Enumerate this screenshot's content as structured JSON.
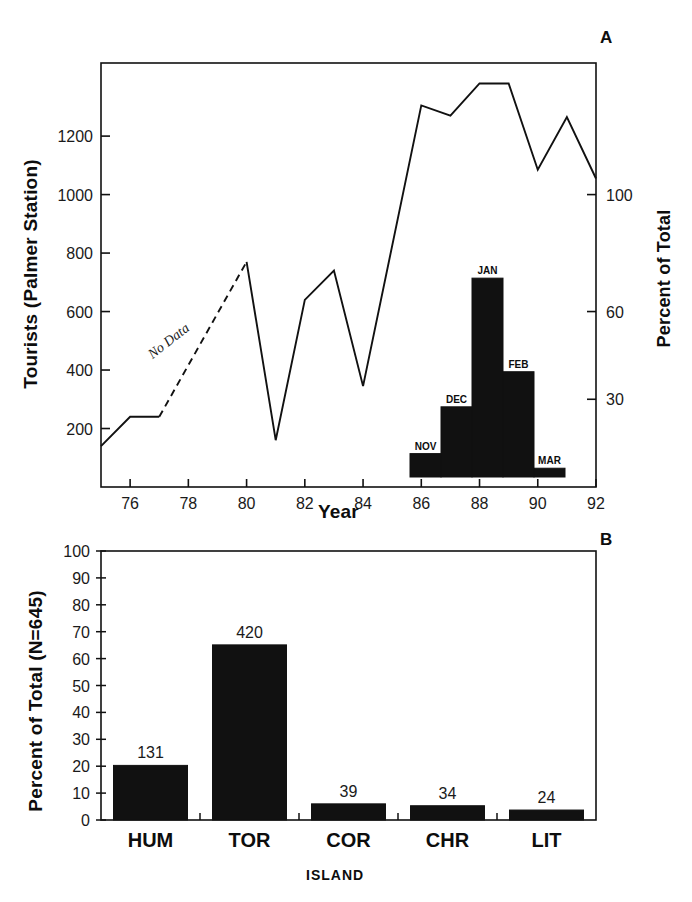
{
  "figure": {
    "panels": [
      {
        "letter": "A",
        "ylabel": "Tourists (Palmer Station)",
        "ylabel_right": "Percent of Total",
        "xlabel": "Year",
        "annotation": "No Data"
      },
      {
        "letter": "B",
        "ylabel": "Percent of Total (N=645)",
        "xlabel": "ISLAND"
      }
    ]
  },
  "chart_data": [
    {
      "type": "line",
      "panel": "A",
      "title": "",
      "xlabel": "Year",
      "ylabel": "Tourists (Palmer Station)",
      "ylabel_right": "Percent of Total",
      "xlim": [
        75,
        92
      ],
      "ylim": [
        0,
        1450
      ],
      "ylim_right": [
        0,
        145
      ],
      "grid": false,
      "legend": "none",
      "xticks": [
        76,
        78,
        80,
        82,
        84,
        86,
        88,
        90,
        92
      ],
      "xtick_labels": [
        "76",
        "78",
        "80",
        "82",
        "84",
        "86",
        "88",
        "90",
        "92"
      ],
      "yticks": [
        200,
        400,
        600,
        800,
        1000,
        1200
      ],
      "ytick_labels": [
        "200",
        "400",
        "600",
        "800",
        "1000",
        "1200"
      ],
      "yticks_right": [
        30,
        60,
        100
      ],
      "ytick_labels_right": [
        "30",
        "60",
        "100"
      ],
      "x": [
        75,
        76,
        77,
        80,
        81,
        82,
        83,
        84,
        86,
        87,
        88,
        89,
        90,
        91,
        92
      ],
      "values": [
        140,
        240,
        240,
        770,
        160,
        640,
        740,
        345,
        1305,
        1270,
        1380,
        1380,
        1085,
        1265,
        1055
      ],
      "segments": [
        {
          "style": "solid",
          "x": [
            75,
            76,
            77
          ],
          "y": [
            140,
            240,
            240
          ]
        },
        {
          "style": "dashed",
          "x": [
            77,
            80
          ],
          "y": [
            240,
            770
          ],
          "annotation": "No Data"
        },
        {
          "style": "solid",
          "x": [
            80,
            81,
            82,
            83,
            84,
            86,
            87,
            88,
            89,
            90,
            91,
            92
          ],
          "y": [
            770,
            160,
            640,
            740,
            345,
            1305,
            1270,
            1380,
            1380,
            1085,
            1265,
            1055
          ]
        }
      ],
      "annotations": [
        {
          "text": "No Data",
          "x": 78.4,
          "y": 490
        }
      ],
      "inset": {
        "type": "bar",
        "title": "",
        "ylabel": "Percent of Total",
        "categories": [
          "NOV",
          "DEC",
          "JAN",
          "FEB",
          "MAR"
        ],
        "values": [
          8,
          24,
          68,
          36,
          3
        ],
        "ylim": [
          0,
          145
        ]
      }
    },
    {
      "type": "bar",
      "panel": "B",
      "title": "",
      "xlabel": "ISLAND",
      "ylabel": "Percent of Total (N=645)",
      "ylim": [
        0,
        100
      ],
      "grid": false,
      "legend": "none",
      "yticks": [
        0,
        10,
        20,
        30,
        40,
        50,
        60,
        70,
        80,
        90,
        100
      ],
      "ytick_labels": [
        "0",
        "10",
        "20",
        "30",
        "40",
        "50",
        "60",
        "70",
        "80",
        "90",
        "100"
      ],
      "categories": [
        "HUM",
        "TOR",
        "COR",
        "CHR",
        "LIT"
      ],
      "values": [
        20.3,
        65.1,
        6.0,
        5.3,
        3.7
      ],
      "counts": [
        131,
        420,
        39,
        34,
        24
      ],
      "count_labels": [
        "131",
        "420",
        "39",
        "34",
        "24"
      ],
      "n_total": 645
    }
  ]
}
